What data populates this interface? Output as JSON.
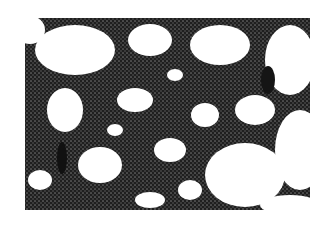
{
  "image": {
    "description": "Grayscale micrograph of dense dark cell clusters forming a reticulated network on a white background",
    "width": 328,
    "height": 230,
    "colors": {
      "background": "#ffffff",
      "cells": "#2e2e2e",
      "cells_dark": "#151515"
    }
  }
}
